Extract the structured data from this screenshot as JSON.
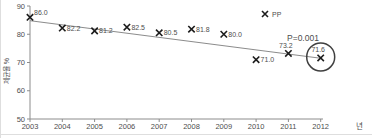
{
  "chart_data": {
    "type": "scatter",
    "title": "",
    "xlabel": "년",
    "ylabel": "제균율 %",
    "x": [
      2003,
      2004,
      2005,
      2006,
      2007,
      2008,
      2009,
      2010,
      2011,
      2012
    ],
    "series": [
      {
        "name": "PP",
        "marker": "x",
        "values": [
          86.0,
          82.2,
          81.2,
          82.5,
          80.5,
          81.8,
          80.0,
          71.0,
          73.2,
          71.6
        ],
        "point_labels": [
          "86.0",
          "82.2",
          "81.2",
          "82.5",
          "80.5",
          "81.8",
          "80.0",
          "71.0",
          "73.2",
          "71.6"
        ]
      }
    ],
    "ylim": [
      50,
      90
    ],
    "yticks": [
      90,
      80,
      70,
      60,
      50
    ],
    "grid": false,
    "legend": {
      "position": "inside-top-right",
      "entries": [
        {
          "marker": "x",
          "label": "PP"
        }
      ]
    },
    "annotations": [
      {
        "text": "P=0.001",
        "near_x": 2011,
        "near_y": 77.6
      }
    ],
    "trend_line": {
      "from": {
        "x": 2003,
        "y": 84.8
      },
      "to": {
        "x": 2012,
        "y": 71.5
      }
    },
    "highlight_circle": {
      "x": 2012,
      "y": 71.6
    }
  },
  "colors": {
    "marker": "#1c1c1c",
    "label_text": "#4d4d4d",
    "trend_line": "#7e7e7e",
    "axis": "#8c8c8c",
    "highlight_circle": "#3f3f3f",
    "panel_border": "#dedede"
  }
}
